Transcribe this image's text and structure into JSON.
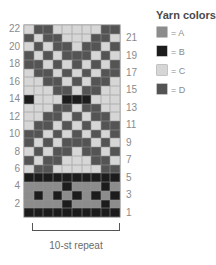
{
  "legend": {
    "title": "Yarn colors",
    "items": [
      {
        "key": "A",
        "label": "= A",
        "color": "#8c8c8c"
      },
      {
        "key": "B",
        "label": "= B",
        "color": "#1c1c1c"
      },
      {
        "key": "C",
        "label": "= C",
        "color": "#d6d6d6"
      },
      {
        "key": "D",
        "label": "= D",
        "color": "#545454"
      }
    ]
  },
  "chart": {
    "repeat_label": "10-st repeat",
    "columns": 10,
    "rows_count": 22,
    "left_row_labels": [
      "22",
      "20",
      "18",
      "16",
      "14",
      "12",
      "10",
      "8",
      "6",
      "4",
      "2"
    ],
    "right_row_labels": [
      "21",
      "19",
      "17",
      "15",
      "13",
      "11",
      "9",
      "7",
      "5",
      "3",
      "1"
    ],
    "rows_top_to_bottom": [
      {
        "row": 22,
        "cells": "CDDCCCCCDD"
      },
      {
        "row": 21,
        "cells": "DCDDCCCDDC"
      },
      {
        "row": 20,
        "cells": "CDCDDCDDCD"
      },
      {
        "row": 19,
        "cells": "DCDCDDDCDC"
      },
      {
        "row": 18,
        "cells": "DDCDCDCDCD"
      },
      {
        "row": 17,
        "cells": "CDDCDCDCDD"
      },
      {
        "row": 16,
        "cells": "CCDDCDCDDC"
      },
      {
        "row": 15,
        "cells": "CCCDDCDDCC"
      },
      {
        "row": 14,
        "cells": "BCCCBBBCCC"
      },
      {
        "row": 13,
        "cells": "CCCDDCDDCC"
      },
      {
        "row": 12,
        "cells": "CCDDCDCDDC"
      },
      {
        "row": 11,
        "cells": "CDDCDCDCDD"
      },
      {
        "row": 10,
        "cells": "DDCDCDCDCD"
      },
      {
        "row": 9,
        "cells": "DCDCDDDCDC"
      },
      {
        "row": 8,
        "cells": "CDCDDCDDCD"
      },
      {
        "row": 7,
        "cells": "DCDDCCCDDC"
      },
      {
        "row": 6,
        "cells": "CDDCCCCCDD"
      },
      {
        "row": 5,
        "cells": "BBBBBBBBBB"
      },
      {
        "row": 4,
        "cells": "AAAABAAABA"
      },
      {
        "row": 3,
        "cells": "ABABABABAB"
      },
      {
        "row": 2,
        "cells": "AAAABAAABA"
      },
      {
        "row": 1,
        "cells": "BBBBBBBBBB"
      }
    ]
  }
}
